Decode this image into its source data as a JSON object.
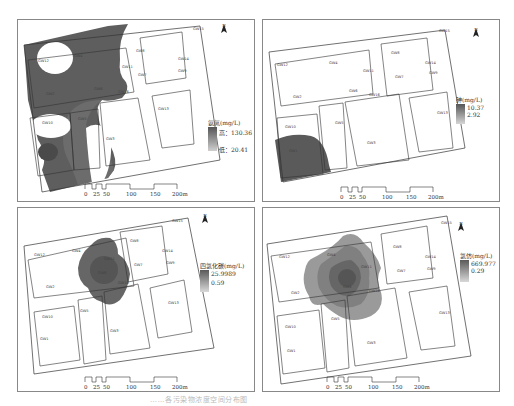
{
  "figure": {
    "caption": "……各污染物浓度空间分布图",
    "top_caption": ""
  },
  "panels": [
    {
      "id": "ammonia",
      "legend": {
        "title": "氨氮(mg/L)",
        "high_label": "高：130.36",
        "low_label": "低：20.41",
        "high": 130.36,
        "low": 20.41,
        "color_high": "#555555",
        "color_low": "#cfcfcf"
      },
      "north_label": "N",
      "scale_labels": [
        "0",
        "25",
        "50",
        "100",
        "150",
        "200m"
      ]
    },
    {
      "id": "arsenic",
      "legend": {
        "title": "砷(mg/L)",
        "high_label": "10.37",
        "low_label": "2.92",
        "high": 10.37,
        "low": 2.92,
        "color_high": "#555555",
        "color_low": "#d5d5d5"
      },
      "north_label": "N",
      "scale_labels": [
        "0",
        "25",
        "50",
        "100",
        "150",
        "200m"
      ]
    },
    {
      "id": "carbon-tetrachloride",
      "legend": {
        "title": "四氯化碳(mg/L)",
        "high_label": "25.9989",
        "low_label": "0.59",
        "high": 25.9989,
        "low": 0.59,
        "color_high": "#5a5a5a",
        "color_low": "#d8d8d8"
      },
      "north_label": "N",
      "scale_labels": [
        "0",
        "25",
        "50",
        "100",
        "150",
        "200m"
      ]
    },
    {
      "id": "chloroform",
      "legend": {
        "title": "氯仿(mg/L)",
        "high_label": "669.977",
        "low_label": "0.29",
        "high": 669.977,
        "low": 0.29,
        "color_high": "#5a5a5a",
        "color_low": "#d8d8d8"
      },
      "north_label": "N",
      "scale_labels": [
        "0",
        "25",
        "50",
        "100",
        "150",
        "200m"
      ]
    }
  ],
  "wells": [
    "GW1",
    "GW2",
    "GW3",
    "GW4",
    "GW5",
    "GW6",
    "GW7",
    "GW8",
    "GW9",
    "GW10",
    "GW11",
    "GW12",
    "GW13",
    "GW14",
    "GW15",
    "GW16"
  ]
}
